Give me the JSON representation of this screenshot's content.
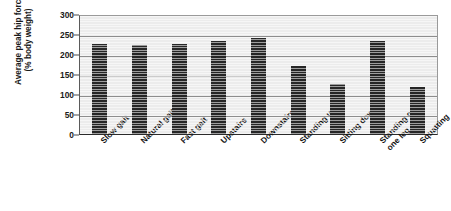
{
  "chart_data": {
    "type": "bar",
    "title": "",
    "subtitle": "",
    "xlabel": "",
    "ylabel": "Average peak hip force (% body weight)",
    "ylabel_lines": [
      "Average peak hip force",
      "(% body weight)"
    ],
    "ylim": [
      0,
      300
    ],
    "ytick_step": 50,
    "yticks": [
      0,
      50,
      100,
      150,
      200,
      250,
      300
    ],
    "ytick_labels": [
      "0",
      "50",
      "100",
      "150",
      "200",
      "250",
      "300"
    ],
    "grid": "horizontal",
    "legend": "none",
    "categories": [
      "Slow gait",
      "Natural gait",
      "Fast gait",
      "Upstairs",
      "Downstairs",
      "Standing up",
      "Sitting down",
      "Standing on one leg",
      "Squatting"
    ],
    "category_label_lines": [
      [
        "Slow gait"
      ],
      [
        "Natural gait"
      ],
      [
        "Fast gait"
      ],
      [
        "Upstairs"
      ],
      [
        "Downstairs"
      ],
      [
        "Standing up"
      ],
      [
        "Sitting down"
      ],
      [
        "Standing on",
        "one leg"
      ],
      [
        "Squatting"
      ]
    ],
    "values": [
      225,
      222,
      226,
      232,
      240,
      170,
      125,
      232,
      118
    ],
    "bar_color": "#262626",
    "plot_background": "#ececec",
    "gridline_color": "#8d8d8d",
    "axis_color": "#2b2b2b"
  }
}
